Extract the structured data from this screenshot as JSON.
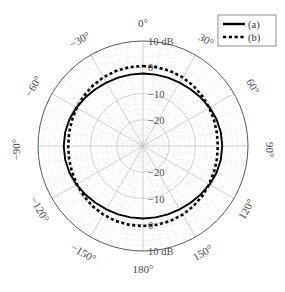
{
  "chart_data": {
    "type": "line",
    "subtype": "polar-radiation-pattern",
    "title": "",
    "rlabel": "dB",
    "rlim": [
      -30,
      10
    ],
    "r_ticks": [
      10,
      0,
      -10,
      -20
    ],
    "r_tick_labels_top": [
      "10 dB",
      "0",
      "-10",
      "-20"
    ],
    "r_tick_labels_bottom": [
      "-20",
      "-10",
      "0",
      "10 dB"
    ],
    "r_outer_label": "10 dB",
    "theta_unit": "degrees",
    "theta_lim": [
      -180,
      180
    ],
    "theta_major_step": 30,
    "theta_minor_step": 10,
    "theta_tick_labels": [
      "0°",
      "30°",
      "60°",
      "90°",
      "120°",
      "150°",
      "180°",
      "-150°",
      "-120°",
      "-90°",
      "-60°",
      "-30°"
    ],
    "theta_tick_values": [
      0,
      30,
      60,
      90,
      120,
      150,
      180,
      -150,
      -120,
      -90,
      -60,
      -30
    ],
    "grid": true,
    "legend_position": "top-right",
    "series": [
      {
        "name": "(a)",
        "style": "solid",
        "color": "#000000",
        "theta": [
          0,
          10,
          20,
          30,
          40,
          50,
          60,
          70,
          80,
          90,
          100,
          110,
          120,
          130,
          140,
          150,
          160,
          170,
          180,
          190,
          200,
          210,
          220,
          230,
          240,
          250,
          260,
          270,
          280,
          290,
          300,
          310,
          320,
          330,
          340,
          350,
          360
        ],
        "values": [
          -2.4,
          -2.4,
          -2.3,
          -2.1,
          -1.8,
          -1.3,
          -0.7,
          -0.2,
          0.1,
          0.2,
          0.1,
          -0.2,
          -0.7,
          -1.3,
          -1.8,
          -2.1,
          -2.3,
          -2.4,
          -2.4,
          -2.4,
          -2.3,
          -2.1,
          -1.8,
          -1.3,
          -0.7,
          -0.2,
          0.1,
          0.2,
          0.1,
          -0.2,
          -0.7,
          -1.3,
          -1.8,
          -2.1,
          -2.3,
          -2.4,
          -2.4
        ]
      },
      {
        "name": "(b)",
        "style": "dotted",
        "color": "#000000",
        "theta": [
          0,
          10,
          20,
          30,
          40,
          50,
          60,
          70,
          80,
          90,
          100,
          110,
          120,
          130,
          140,
          150,
          160,
          170,
          180,
          190,
          200,
          210,
          220,
          230,
          240,
          250,
          260,
          270,
          280,
          290,
          300,
          310,
          320,
          330,
          340,
          350,
          360
        ],
        "values": [
          0.5,
          0.5,
          0.4,
          0.2,
          -0.1,
          -0.5,
          -0.9,
          -1.2,
          -1.4,
          -1.5,
          -1.4,
          -1.2,
          -0.9,
          -0.5,
          -0.1,
          0.2,
          0.4,
          0.5,
          0.5,
          0.5,
          0.4,
          0.2,
          -0.1,
          -0.5,
          -0.9,
          -1.2,
          -1.4,
          -1.5,
          -1.4,
          -1.2,
          -0.9,
          -0.5,
          -0.1,
          0.2,
          0.4,
          0.5,
          0.5
        ]
      }
    ]
  },
  "axis": {
    "angle_labels": [
      {
        "text": "0°",
        "value": 0
      },
      {
        "text": "30°",
        "value": 30
      },
      {
        "text": "60°",
        "value": 60
      },
      {
        "text": "90°",
        "value": 90
      },
      {
        "text": "120°",
        "value": 120
      },
      {
        "text": "150°",
        "value": 150
      },
      {
        "text": "180°",
        "value": 180
      },
      {
        "text": "−150°",
        "value": -150
      },
      {
        "text": "−120°",
        "value": -120
      },
      {
        "text": "−90°",
        "value": -90
      },
      {
        "text": "−60°",
        "value": -60
      },
      {
        "text": "−30°",
        "value": -30
      }
    ],
    "radial_labels_top": [
      {
        "text": "10 dB",
        "value": 10
      },
      {
        "text": "0",
        "value": 0
      },
      {
        "text": "−10",
        "value": -10
      },
      {
        "text": "−20",
        "value": -20
      }
    ],
    "radial_labels_bottom": [
      {
        "text": "−20",
        "value": -20
      },
      {
        "text": "−10",
        "value": -10
      },
      {
        "text": "0",
        "value": 0
      },
      {
        "text": "10 dB",
        "value": 10
      }
    ]
  },
  "legend": {
    "entries": [
      {
        "label": "(a)",
        "style": "solid"
      },
      {
        "label": "(b)",
        "style": "dotted"
      }
    ]
  },
  "colors": {
    "curve": "#000000",
    "outer_ring": "#55585c",
    "grid_major": "#b9bcc0",
    "grid_minor": "#c9ccd0",
    "text": "#4a4a4a",
    "legend_border": "#8a8d91",
    "background": "#ffffff"
  }
}
